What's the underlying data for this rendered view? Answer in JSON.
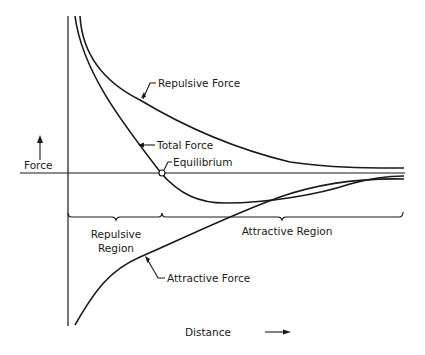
{
  "diagram": {
    "y_axis_label": "Force",
    "x_axis_label": "Distance",
    "curves": {
      "repulsive": "Repulsive Force",
      "total": "Total Force",
      "attractive": "Attractive Force"
    },
    "points": {
      "equilibrium": "Equilibrium"
    },
    "regions": {
      "repulsive_line1": "Repulsive",
      "repulsive_line2": "Region",
      "attractive": "Attractive Region"
    },
    "colors": {
      "ink": "#1a1a1a",
      "background": "#ffffff"
    }
  }
}
